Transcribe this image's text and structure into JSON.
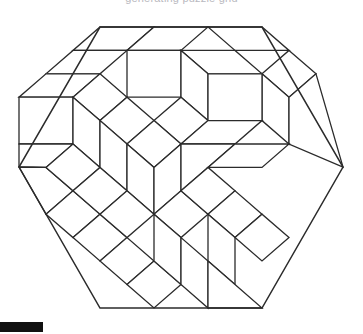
{
  "page": {
    "background_color": "#ffffff",
    "width": 363,
    "height": 334
  },
  "caption": {
    "text": "generating puzzle grid",
    "color": "#b9b9c0",
    "visible_partial": true
  },
  "figure": {
    "name": "rhombus-tiled-hexagon",
    "shape": "regular-hexagon",
    "orientation": "flat-top",
    "stroke_color": "#2b2b2b",
    "fill_color": "#ffffff",
    "stroke_width": 1.3,
    "center_x": 181,
    "center_y": 167.5,
    "half_width": 162,
    "half_height": 140.5,
    "corners": [
      [
        100,
        27
      ],
      [
        262,
        27
      ],
      [
        343,
        167
      ],
      [
        262,
        308
      ],
      [
        100,
        308
      ],
      [
        19,
        167
      ]
    ],
    "unit_columns": 6,
    "unit_rows": 6,
    "tile_count": 41
  },
  "progress": {
    "label": "progress-bar",
    "color": "#111111",
    "x": 0,
    "y": 322,
    "width": 43,
    "height": 10
  },
  "chart_data": {
    "type": "diagram",
    "lattice": {
      "unit_a": [
        27,
        -23.4
      ],
      "unit_b": [
        27,
        23.4
      ],
      "unit_c": [
        0,
        46.8
      ],
      "origin": [
        19,
        167
      ]
    },
    "tiles": [
      {
        "id": 1,
        "type": "rhombus",
        "orientation": "left",
        "points": "100,27 154,27 127,50.4 73,50.4"
      },
      {
        "id": 2,
        "type": "rhombus",
        "orientation": "left",
        "points": "73,50.4 127,50.4 100,73.8 46,73.8"
      },
      {
        "id": 3,
        "type": "rhombus",
        "orientation": "left",
        "points": "46,73.8 100,73.8 73,97.2 19,97.2"
      },
      {
        "id": 4,
        "type": "rhombus",
        "orientation": "vert",
        "points": "19,97.2 73,97.2 73,144 19,144"
      },
      {
        "id": 5,
        "type": "rhombus",
        "orientation": "right",
        "points": "19,144 73,144 46,167.4 19,167"
      },
      {
        "id": 6,
        "type": "rhombus",
        "orientation": "right",
        "points": "19,167 46,167.4 73,190.8 46,214.2"
      },
      {
        "id": 7,
        "type": "rhombus",
        "orientation": "right",
        "points": "46,214.2 73,190.8 100,214.2 73,237.6"
      },
      {
        "id": 8,
        "type": "rhombus",
        "orientation": "right",
        "points": "73,237.6 100,214.2 127,237.6 100,261"
      },
      {
        "id": 9,
        "type": "rhombus",
        "orientation": "right",
        "points": "100,261 127,237.6 154,261 127,284.4"
      },
      {
        "id": 10,
        "type": "rhombus",
        "orientation": "vert",
        "points": "127,284.4 154,261 181,284.4 154,308"
      },
      {
        "id": 11,
        "type": "rhombus",
        "orientation": "left",
        "points": "154,27 208,27 181,50.4 127,50.4"
      },
      {
        "id": 12,
        "type": "rhombus",
        "orientation": "vert",
        "points": "127,50.4 181,50.4 181,97.2 127,97.2"
      },
      {
        "id": 13,
        "type": "rhombus",
        "orientation": "left",
        "points": "100,73.8 127,97.2 100,120.6 73,97.2"
      },
      {
        "id": 14,
        "type": "rhombus",
        "orientation": "left",
        "points": "73,97.2 100,120.6 100,167.4 73,144"
      },
      {
        "id": 15,
        "type": "rhombus",
        "orientation": "right",
        "points": "73,144 100,167.4 73,190.8 46,167.4"
      },
      {
        "id": 16,
        "type": "rhombus",
        "orientation": "vert",
        "points": "100,120.6 127,97.2 154,120.6 127,144"
      },
      {
        "id": 17,
        "type": "rhombus",
        "orientation": "vert",
        "points": "100,167.4 100,120.6 127,144 127,190.8"
      },
      {
        "id": 18,
        "type": "rhombus",
        "orientation": "right",
        "points": "100,167.4 127,190.8 100,214.2 73,190.8"
      },
      {
        "id": 19,
        "type": "rhombus",
        "orientation": "left",
        "points": "208,27 262,27 289,50.4 235,50.4"
      },
      {
        "id": 20,
        "type": "rhombus",
        "orientation": "left",
        "points": "181,50.4 235,50.4 262,73.8 208,73.8"
      },
      {
        "id": 21,
        "type": "rhombus",
        "orientation": "vert",
        "points": "181,50.4 208,73.8 208,120.6 181,97.2"
      },
      {
        "id": 22,
        "type": "rhombus",
        "orientation": "right",
        "points": "181,97.2 208,120.6 181,144 154,120.6"
      },
      {
        "id": 23,
        "type": "rhombus",
        "orientation": "right",
        "points": "154,120.6 181,144 154,167.4 127,144"
      },
      {
        "id": 24,
        "type": "rhombus",
        "orientation": "vert",
        "points": "127,144 154,167.4 154,214.2 127,190.8"
      },
      {
        "id": 25,
        "type": "rhombus",
        "orientation": "right",
        "points": "127,190.8 154,214.2 127,237.6 100,214.2"
      },
      {
        "id": 26,
        "type": "rhombus",
        "orientation": "vert",
        "points": "154,167.4 181,144 181,190.8 154,214.2"
      },
      {
        "id": 27,
        "type": "rhombus",
        "orientation": "left",
        "points": "154,214.2 181,190.8 208,214.2 181,237.6"
      },
      {
        "id": 28,
        "type": "rhombus",
        "orientation": "vert",
        "points": "154,261 154,214.2 181,237.6 181,284.4"
      },
      {
        "id": 29,
        "type": "rhombus",
        "orientation": "left",
        "points": "181,284.4 181,237.6 208,261 208,308"
      },
      {
        "id": 30,
        "type": "rhombus",
        "orientation": "left",
        "points": "289,50.4 316,73.8 289,97.2 262,73.8"
      },
      {
        "id": 31,
        "type": "rhombus",
        "orientation": "vert",
        "points": "262,73.8 289,97.2 289,144 262,120.6"
      },
      {
        "id": 32,
        "type": "rhombus",
        "orientation": "left",
        "points": "208,73.8 262,73.8 262,120.6 208,120.6"
      },
      {
        "id": 33,
        "type": "rhombus",
        "orientation": "right",
        "points": "208,120.6 262,120.6 235,144 181,144"
      },
      {
        "id": 34,
        "type": "rhombus",
        "orientation": "right",
        "points": "181,144 235,144 208,167.4 181,190.8"
      },
      {
        "id": 35,
        "type": "rhombus",
        "orientation": "left",
        "points": "181,190.8 208,167.4 235,190.8 208,214.2"
      },
      {
        "id": 36,
        "type": "rhombus",
        "orientation": "left",
        "points": "208,214.2 235,190.8 262,214.2 235,237.6"
      },
      {
        "id": 37,
        "type": "rhombus",
        "orientation": "vert",
        "points": "208,261 208,214.2 235,237.6 235,284.4"
      },
      {
        "id": 38,
        "type": "rhombus",
        "orientation": "left",
        "points": "208,308 208,261 235,284.4 262,308"
      },
      {
        "id": 39,
        "type": "rhombus",
        "orientation": "vert",
        "points": "289,144 289,97.2 316,73.8 343,167"
      },
      {
        "id": 40,
        "type": "rhombus",
        "orientation": "right",
        "points": "235,144 289,144 262,167.4 208,167.4"
      },
      {
        "id": 41,
        "type": "rhombus",
        "orientation": "right",
        "points": "235,237.6 262,214.2 289,237.6 262,261"
      }
    ]
  }
}
